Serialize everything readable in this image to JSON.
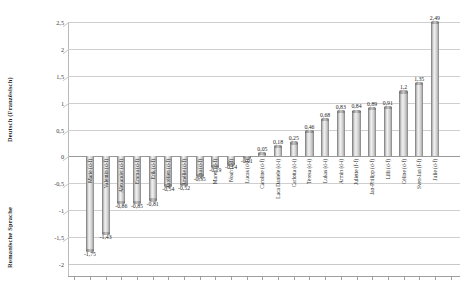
{
  "axes": {
    "y_title_top": "Deutsch (Französisch)",
    "y_title_bottom": "Romanische Sprache",
    "y_ticks": [
      "2,5",
      "2",
      "1,5",
      "1",
      "0,5",
      "0",
      "-0,5",
      "-1",
      "-1,5",
      "-2"
    ]
  },
  "chart_data": {
    "type": "bar",
    "title": "",
    "xlabel": "",
    "ylabel": "Deutsch (Französisch) / Romanische Sprache",
    "ylim": [
      -2,
      2.5
    ],
    "ytick_values": [
      2.5,
      2,
      1.5,
      1,
      0.5,
      0,
      -0.5,
      -1,
      -1.5,
      -2
    ],
    "ytick_labels": [
      "2,5",
      "2",
      "1,5",
      "1",
      "0,5",
      "0",
      "-0,5",
      "-1",
      "-1,5",
      "-2"
    ],
    "grid": true,
    "legend": "none",
    "decimal_separator": ",",
    "categories": [
      "Marie (d-f)",
      "Valentin (d-f)",
      "Alexander (d-f)",
      "Emma (d-f)",
      "Erik (d-f)",
      "Aurélien (d-f)",
      "Amélie (d-f)",
      "Sina (d-f)",
      "Maren (d-f)",
      "Noah (d-f)",
      "Lucas (d-f)",
      "Caroline (d-f)",
      "Luca Daniele (d-i)",
      "Carlotta (d-i)",
      "Teresa (d-i)",
      "Lukas (d-i)",
      "Armin (d-i)",
      "Juliette (f-f)",
      "Jan-Philipp (d-f)",
      "Lilli (d-f)",
      "Céline (d-f)",
      "Sven-Jan (f-f)",
      "Julie (d-f)"
    ],
    "values": [
      -1.75,
      -1.43,
      -0.86,
      -0.85,
      -0.81,
      -0.54,
      -0.52,
      -0.35,
      -0.19,
      -0.14,
      -0.01,
      0.05,
      0.18,
      0.25,
      0.46,
      0.68,
      0.83,
      0.84,
      0.89,
      0.91,
      1.2,
      1.35,
      2.49
    ],
    "value_labels": [
      "-1,75",
      "-1,43",
      "-0,86",
      "-0,85",
      "-0,81",
      "-0,54",
      "-0,52",
      "-0,35",
      "-0,19",
      "-0,14",
      "-0,01",
      "0,05",
      "0,18",
      "0,25",
      "0,46",
      "0,68",
      "0,83",
      "0,84",
      "0,89",
      "0,91",
      "1,2",
      "1,35",
      "2,49"
    ]
  }
}
